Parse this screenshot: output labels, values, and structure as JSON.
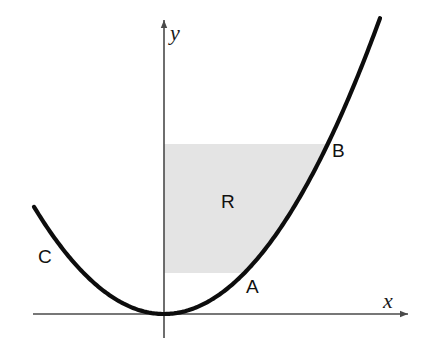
{
  "figure": {
    "background_color": "#ffffff",
    "width": 434,
    "height": 353
  },
  "axes": {
    "x_axis": {
      "label": "x",
      "label_x": 383,
      "label_y": 308,
      "line_y": 314,
      "x_start": 33,
      "x_end": 408,
      "color": "#4a4a4a",
      "arrow": "right"
    },
    "y_axis": {
      "label": "y",
      "label_x": 170,
      "label_y": 40,
      "line_x": 164,
      "y_start": 20,
      "y_end": 338,
      "color": "#4a4a4a",
      "arrow": "up"
    }
  },
  "curve": {
    "name": "parabola",
    "label": "C",
    "label_x": 38,
    "label_y": 263,
    "color": "#0d0d0d",
    "stroke_width": 4.2,
    "vertex": {
      "x": 164,
      "y": 314
    },
    "coefficient_a": 0.00634,
    "x_domain": [
      34,
      380
    ],
    "path": "M 34 205 Q 99 314 164 314 Q 272 314 380 18"
  },
  "shaded_region": {
    "label": "R",
    "label_x": 221,
    "label_y": 208,
    "fill_color": "#e4e4e4",
    "top_y": 144,
    "bottom_y": 273,
    "left_x": 164,
    "path": "M 164 144 L 328 144 Q 290 185 262 228 Q 250 251 244 273 L 164 273 Z"
  },
  "points": [
    {
      "label": "A",
      "label_x": 246,
      "label_y": 293,
      "marker_x": 244,
      "marker_y": 273,
      "description": "lower intersection of parabola and region boundary"
    },
    {
      "label": "B",
      "label_x": 332,
      "label_y": 157,
      "marker_x": 328,
      "marker_y": 144,
      "description": "upper intersection of parabola and region boundary"
    }
  ]
}
